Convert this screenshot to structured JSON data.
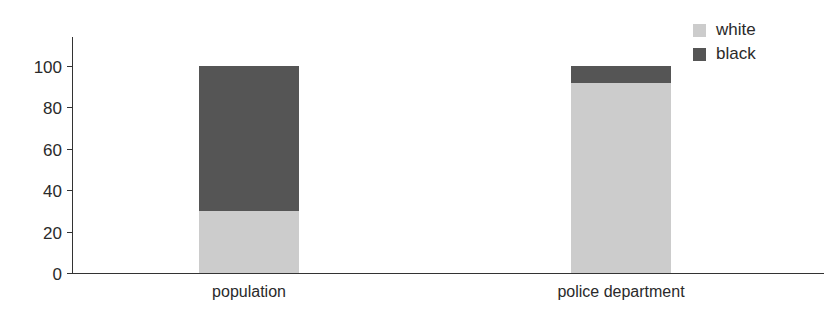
{
  "chart_data": {
    "type": "bar",
    "stacked": true,
    "title": "",
    "xlabel": "",
    "ylabel": "",
    "categories": [
      "population",
      "police department"
    ],
    "series": [
      {
        "name": "white",
        "color": "#cccccc",
        "values": [
          30,
          92
        ]
      },
      {
        "name": "black",
        "color": "#555555",
        "values": [
          70,
          8
        ]
      }
    ],
    "ylim": [
      0,
      100
    ],
    "yticks": [
      0,
      20,
      40,
      60,
      80,
      100
    ],
    "grid": false,
    "legend_position": "top-right"
  },
  "legend": {
    "items": [
      {
        "label": "white",
        "color": "#cccccc"
      },
      {
        "label": "black",
        "color": "#555555"
      }
    ]
  },
  "axis": {
    "yticks": [
      "0",
      "20",
      "40",
      "60",
      "80",
      "100"
    ]
  },
  "categories": [
    "population",
    "police department"
  ]
}
